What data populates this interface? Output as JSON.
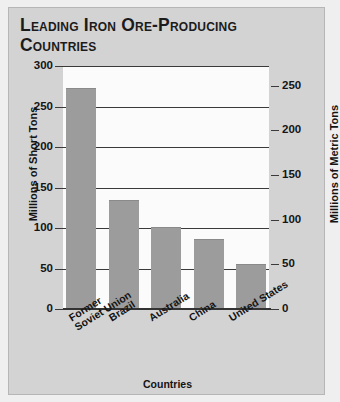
{
  "chart_data": {
    "type": "bar",
    "title": "Leading Iron Ore-Producing Countries",
    "xlabel": "Countries",
    "ylabel": "Millions of Short Tons",
    "ylabel_secondary": "Millions of Metric Tons",
    "categories": [
      "Former\nSoviet Union",
      "Brazil",
      "Australia",
      "China",
      "United States"
    ],
    "values": [
      273,
      135,
      101,
      87,
      56
    ],
    "ylim": [
      0,
      300
    ],
    "yticks": [
      0,
      50,
      100,
      150,
      200,
      250,
      300
    ],
    "ylim_secondary": [
      0,
      272
    ],
    "yticks_secondary": [
      0,
      50,
      100,
      150,
      200,
      250
    ],
    "grid": true,
    "legend": "none",
    "bar_color": "#9c9c9c",
    "plot_background": "#fbfbfb",
    "panel_background": "#d3d3d3",
    "axis_color": "#333333"
  }
}
